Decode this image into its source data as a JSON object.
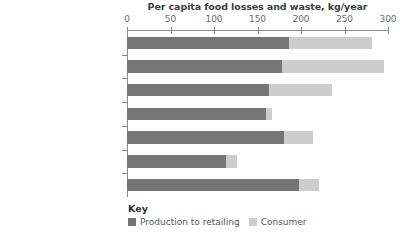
{
  "chart_data": {
    "type": "bar",
    "orientation": "horizontal",
    "stacked": true,
    "title": "Per capita food losses and waste, kg/year",
    "xlabel": "",
    "ylabel": "",
    "xlim": [
      0,
      300
    ],
    "xticks": [
      0,
      50,
      100,
      150,
      200,
      250,
      300
    ],
    "xticklabels": [
      "0",
      "50",
      "100",
      "150",
      "200",
      "250",
      "300"
    ],
    "grid": false,
    "legend_position": "bottom-left",
    "legend_title": "Key",
    "categories": [
      "Europe",
      "North America and Oceania",
      "Industrialised Asia",
      "Sub-Saharan Africa",
      "North Africa, West\nand Central Asia",
      "South and Southeast Asia",
      "Latin America"
    ],
    "series": [
      {
        "name": "Production to retailing",
        "color": "#757575",
        "values": [
          186,
          178,
          163,
          160,
          181,
          114,
          198
        ]
      },
      {
        "name": "Consumer",
        "color": "#cdcdcd",
        "values": [
          96,
          117,
          73,
          7,
          33,
          12,
          23
        ]
      }
    ],
    "totals": [
      282,
      295,
      236,
      167,
      214,
      126,
      221
    ]
  }
}
